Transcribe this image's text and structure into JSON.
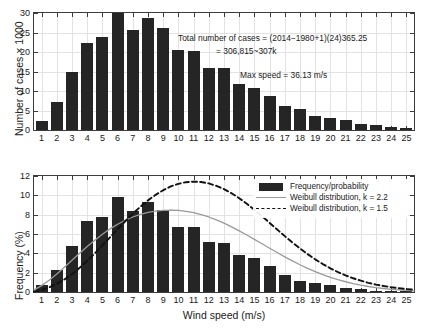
{
  "chart_data": [
    {
      "type": "bar",
      "panel": "top",
      "title": "",
      "xlabel": "",
      "ylabel": "Number of cases  × 1000",
      "categories": [
        1,
        2,
        3,
        4,
        5,
        6,
        7,
        8,
        9,
        10,
        11,
        12,
        13,
        14,
        15,
        16,
        17,
        18,
        19,
        20,
        21,
        22,
        23,
        24,
        25
      ],
      "values": [
        2.4,
        7.2,
        14.8,
        22.3,
        23.9,
        30.0,
        25.6,
        28.7,
        26.1,
        20.4,
        20.3,
        16.0,
        15.8,
        11.8,
        10.8,
        8.6,
        6.1,
        5.5,
        3.7,
        3.1,
        2.5,
        1.5,
        1.3,
        0.8,
        0.6
      ],
      "ylim": [
        0,
        30
      ],
      "yticks": [
        0,
        5,
        10,
        15,
        20,
        25,
        30
      ],
      "xlim": [
        0.5,
        25.5
      ],
      "grid": true,
      "annotations": [
        "Total number of cases = (2014−1980+1)(24)365.25",
        "= 306,815~307k",
        "Max speed = 36.13 m/s"
      ]
    },
    {
      "type": "bar",
      "panel": "bottom",
      "title": "",
      "xlabel": "Wind speed (m/s)",
      "ylabel": "Frequency (%)",
      "categories": [
        1,
        2,
        3,
        4,
        5,
        6,
        7,
        8,
        9,
        10,
        11,
        12,
        13,
        14,
        15,
        16,
        17,
        18,
        19,
        20,
        21,
        22,
        23,
        24,
        25
      ],
      "values": [
        0.7,
        2.3,
        4.8,
        7.3,
        7.8,
        9.8,
        8.4,
        9.35,
        8.5,
        6.7,
        6.7,
        5.2,
        5.1,
        3.85,
        3.5,
        2.65,
        1.75,
        1.1,
        0.95,
        0.7,
        0.4,
        0.3,
        0.15,
        0.1,
        0.05
      ],
      "ylim": [
        0,
        12
      ],
      "yticks": [
        0,
        2,
        4,
        6,
        8,
        10,
        12
      ],
      "xlim": [
        0.5,
        25.5
      ],
      "grid": true,
      "series": [
        {
          "name": "Weibull distribution, k = 2.2",
          "style": "solid",
          "color": "#9a9a9a",
          "k": 2.2,
          "scale": 9.6,
          "peak": 8.7,
          "x": [
            0.5,
            1,
            1.5,
            2,
            2.5,
            3,
            3.5,
            4,
            4.5,
            5,
            5.5,
            6,
            6.5,
            7,
            7.5,
            8,
            8.5,
            9,
            9.5,
            10,
            10.5,
            11,
            11.5,
            12,
            12.5,
            13,
            13.5,
            14,
            14.5,
            15,
            15.5,
            16,
            16.5,
            17,
            17.5,
            18,
            18.5,
            19,
            19.5,
            20,
            20.5,
            21,
            21.5,
            22,
            22.5,
            23,
            23.5,
            24,
            24.5,
            25,
            25.5
          ],
          "y": [
            0.22,
            0.66,
            1.22,
            1.86,
            2.55,
            3.28,
            4.0,
            4.7,
            5.36,
            5.98,
            6.53,
            7.01,
            7.42,
            7.76,
            8.03,
            8.23,
            8.37,
            8.45,
            8.47,
            8.44,
            8.35,
            8.21,
            8.01,
            7.76,
            7.46,
            7.12,
            6.74,
            6.33,
            5.9,
            5.45,
            4.99,
            4.53,
            4.08,
            3.64,
            3.22,
            2.82,
            2.45,
            2.11,
            1.8,
            1.52,
            1.27,
            1.06,
            0.87,
            0.71,
            0.57,
            0.45,
            0.36,
            0.28,
            0.21,
            0.16,
            0.12
          ]
        },
        {
          "name": "Weibull distribution, k = 1.5",
          "style": "dashed",
          "color": "#111111",
          "k": 1.5,
          "scale": 11.4,
          "peak": 9.2,
          "x": [
            0.5,
            1,
            1.5,
            2,
            2.5,
            3,
            3.5,
            4,
            4.5,
            5,
            5.5,
            6,
            6.5,
            7,
            7.5,
            8,
            8.5,
            9,
            9.5,
            10,
            10.5,
            11,
            11.5,
            12,
            12.5,
            13,
            13.5,
            14,
            14.5,
            15,
            15.5,
            16,
            16.5,
            17,
            17.5,
            18,
            18.5,
            19,
            19.5,
            20,
            20.5,
            21,
            21.5,
            22,
            22.5,
            23,
            23.5,
            24,
            24.5,
            25,
            25.5
          ],
          "y": [
            0.05,
            0.22,
            0.49,
            0.85,
            1.3,
            1.85,
            2.5,
            3.22,
            4.0,
            4.82,
            5.66,
            6.5,
            7.32,
            8.1,
            8.82,
            9.48,
            10.05,
            10.53,
            10.92,
            11.19,
            11.36,
            11.42,
            11.38,
            11.23,
            10.98,
            10.64,
            10.21,
            9.7,
            9.13,
            8.5,
            7.84,
            7.15,
            6.46,
            5.78,
            5.12,
            4.5,
            3.92,
            3.38,
            2.89,
            2.45,
            2.06,
            1.72,
            1.42,
            1.17,
            0.95,
            0.77,
            0.62,
            0.49,
            0.39,
            0.3,
            0.24
          ]
        }
      ],
      "legend": {
        "position": "top-right",
        "entries": [
          {
            "label": "Frequency/probability",
            "key": "bar-swatch"
          },
          {
            "label": "Weibull distribution, k = 2.2",
            "key": "solid-line"
          },
          {
            "label": "Weibull distribution, k = 1.5",
            "key": "dashed-line"
          }
        ]
      }
    }
  ],
  "top": {
    "ylabel": "Number of cases  × 1000",
    "annotation_line1": "Total number of cases = (2014−1980+1)(24)365.25",
    "annotation_line2": "= 306,815~307k",
    "annotation_line3": "Max speed = 36.13 m/s"
  },
  "bottom": {
    "ylabel": "Frequency (%)",
    "xlabel": "Wind speed (m/s)",
    "legend": {
      "entry1": "Frequency/probability",
      "entry2": "Weibull distribution, k = 2.2",
      "entry3": "Weibull distribution, k = 1.5"
    }
  }
}
